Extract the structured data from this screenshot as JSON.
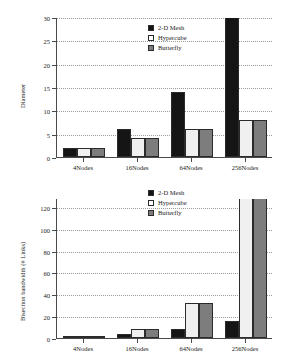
{
  "figure": {
    "background": "#ffffff",
    "series_colors": {
      "2-D Mesh": "#151515",
      "Hypercube": "#f0f0f0",
      "Butterfly": "#7d7d7d"
    }
  },
  "chart_data": [
    {
      "type": "bar",
      "title": "",
      "xlabel": "",
      "ylabel": "Diameter",
      "categories": [
        "4Nodes",
        "16Nodes",
        "64Nodes",
        "256Nodes"
      ],
      "series": [
        {
          "name": "2-D Mesh",
          "values": [
            2,
            6,
            14,
            30
          ]
        },
        {
          "name": "Hypercube",
          "values": [
            2,
            4,
            6,
            8
          ]
        },
        {
          "name": "Butterfly",
          "values": [
            2,
            4,
            6,
            8
          ]
        }
      ],
      "ylim": [
        0,
        30
      ],
      "yticks": [
        0,
        5,
        10,
        15,
        20,
        25,
        30
      ],
      "ytick_labels": [
        "0",
        "5",
        "10",
        "15",
        "20",
        "25",
        "30"
      ],
      "grid": true,
      "legend": [
        "2-D Mesh",
        "Hypercube",
        "Butterfly"
      ],
      "legend_position": "upper center"
    },
    {
      "type": "bar",
      "title": "",
      "xlabel": "",
      "ylabel": "Bisection bandwidth (# Links)",
      "categories": [
        "4Nodes",
        "16Nodes",
        "64Nodes",
        "256Nodes"
      ],
      "series": [
        {
          "name": "2-D Mesh",
          "values": [
            2,
            4,
            8,
            16
          ]
        },
        {
          "name": "Hypercube",
          "values": [
            2,
            8,
            32,
            128
          ]
        },
        {
          "name": "Butterfly",
          "values": [
            2,
            8,
            32,
            128
          ]
        }
      ],
      "ylim": [
        0,
        128
      ],
      "yticks": [
        0,
        20,
        40,
        60,
        80,
        100,
        120
      ],
      "ytick_labels": [
        "0",
        "20",
        "40",
        "60",
        "80",
        "100",
        "120"
      ],
      "grid": true,
      "legend": [
        "2-D Mesh",
        "Hypercube",
        "Butterfly"
      ],
      "legend_position": "upper center"
    }
  ]
}
